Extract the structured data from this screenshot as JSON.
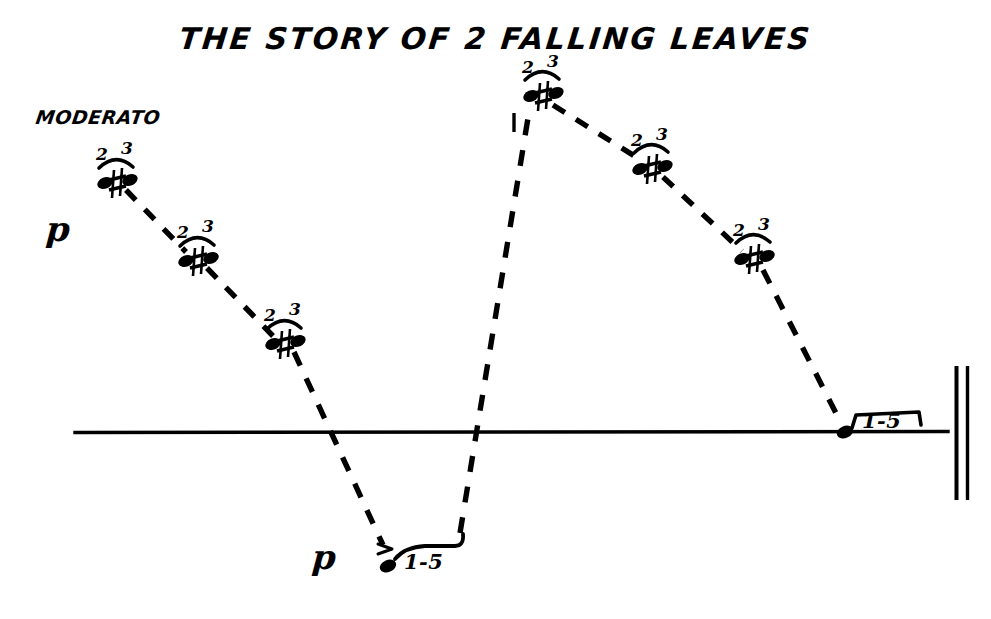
{
  "page": {
    "width": 991,
    "height": 619,
    "background": "#ffffff",
    "ink": "#000000"
  },
  "score": {
    "title": "THE STORY OF 2 FALLING LEAVES",
    "tempo_marking": "MODERATO",
    "staff": {
      "line_y": 432,
      "line_x_start": 75,
      "line_x_end": 948
    },
    "final_barline": {
      "type": "double-barline",
      "x1": 956,
      "x2": 967,
      "y_top": 366,
      "y_bottom": 500
    },
    "dynamics": [
      {
        "label": "p",
        "x": 46,
        "y": 212
      },
      {
        "label": "p",
        "x": 312,
        "y": 540
      }
    ],
    "notes": [
      {
        "id": "n1",
        "x": 112,
        "y": 186,
        "fingering": [
          "2",
          "3"
        ],
        "accidental": "#",
        "type": "dyad",
        "slur": true
      },
      {
        "id": "n2",
        "x": 193,
        "y": 263,
        "fingering": [
          "2",
          "3"
        ],
        "accidental": "#",
        "type": "dyad",
        "slur": true
      },
      {
        "id": "n3",
        "x": 281,
        "y": 346,
        "fingering": [
          "2",
          "3"
        ],
        "accidental": "#",
        "type": "dyad",
        "slur": true
      },
      {
        "id": "n4",
        "x": 388,
        "y": 566,
        "fingering": [],
        "accidental": "",
        "type": "single",
        "slur": false,
        "accent": ">",
        "span_label": "1-5"
      },
      {
        "id": "n5",
        "x": 538,
        "y": 98,
        "fingering": [
          "2",
          "3"
        ],
        "accidental": "#",
        "type": "dyad",
        "slur": true
      },
      {
        "id": "n6",
        "x": 648,
        "y": 171,
        "fingering": [
          "2",
          "3"
        ],
        "accidental": "#",
        "type": "dyad",
        "slur": true
      },
      {
        "id": "n7",
        "x": 750,
        "y": 261,
        "fingering": [
          "2",
          "3"
        ],
        "accidental": "#",
        "type": "dyad",
        "slur": true
      },
      {
        "id": "n8",
        "x": 845,
        "y": 432,
        "fingering": [],
        "accidental": "",
        "type": "single",
        "slur": false,
        "span_label": "1-5"
      }
    ],
    "span_labels": [
      {
        "text": "1-5",
        "x": 404,
        "y": 552,
        "anchor": "bottom-note"
      },
      {
        "text": "1-5",
        "x": 860,
        "y": 412,
        "anchor": "final-note"
      }
    ],
    "fingering_groups": [
      {
        "note": "n1",
        "left": "2",
        "right": "3",
        "lx": 99,
        "ly": 150,
        "rx": 124,
        "ry": 144
      },
      {
        "note": "n2",
        "left": "2",
        "right": "3",
        "lx": 180,
        "ly": 228,
        "rx": 205,
        "ry": 222
      },
      {
        "note": "n3",
        "left": "2",
        "right": "3",
        "lx": 267,
        "ly": 311,
        "rx": 292,
        "ry": 305
      },
      {
        "note": "n5",
        "left": "2",
        "right": "3",
        "lx": 525,
        "ly": 63,
        "rx": 550,
        "ry": 57
      },
      {
        "note": "n6",
        "left": "2",
        "right": "3",
        "lx": 634,
        "ly": 136,
        "rx": 659,
        "ry": 130
      },
      {
        "note": "n7",
        "left": "2",
        "right": "3",
        "lx": 736,
        "ly": 226,
        "rx": 761,
        "ry": 220
      }
    ],
    "melody_path": [
      [
        112,
        186
      ],
      [
        193,
        263
      ],
      [
        281,
        346
      ],
      [
        388,
        566
      ],
      [
        538,
        98
      ],
      [
        648,
        171
      ],
      [
        750,
        261
      ],
      [
        845,
        432
      ]
    ],
    "line_style": "dashed"
  }
}
